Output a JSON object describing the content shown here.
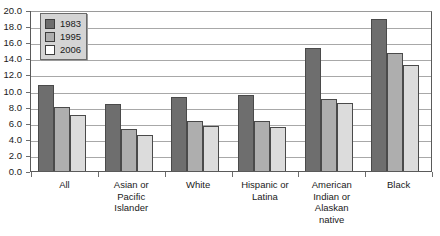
{
  "chart_data": {
    "type": "bar",
    "title": "",
    "subtitle": "",
    "xlabel": "",
    "ylabel": "",
    "ylim": [
      0.0,
      20.0
    ],
    "ytick_step": 2.0,
    "ytick_labels": [
      "20.0",
      "18.0",
      "16.0",
      "14.0",
      "12.0",
      "10.0",
      "8.0",
      "6.0",
      "4.0",
      "2.0",
      "0.0"
    ],
    "ytick_values": [
      20.0,
      18.0,
      16.0,
      14.0,
      12.0,
      10.0,
      8.0,
      6.0,
      4.0,
      2.0,
      0.0
    ],
    "grid": true,
    "grid_axis": "y",
    "legend_position": "top-left",
    "categories": [
      "All",
      "Asian or Pacific Islander",
      "White",
      "Hispanic or Latina",
      "American Indian or Alaskan native",
      "Black"
    ],
    "category_label_lines": [
      [
        "All"
      ],
      [
        "Asian or",
        "Pacific",
        "Islander"
      ],
      [
        "White"
      ],
      [
        "Hispanic or",
        "Latina"
      ],
      [
        "American",
        "Indian or",
        "Alaskan",
        "native"
      ],
      [
        "Black"
      ]
    ],
    "series": [
      {
        "name": "1983",
        "color": "#6e6e6e",
        "values": [
          10.7,
          8.3,
          9.2,
          9.4,
          15.3,
          18.9
        ]
      },
      {
        "name": "1995",
        "color": "#aeaeae",
        "values": [
          7.9,
          5.2,
          6.2,
          6.2,
          9.0,
          14.6
        ]
      },
      {
        "name": "2006",
        "color": "#dcdcdc",
        "values": [
          7.0,
          4.5,
          5.6,
          5.5,
          8.4,
          13.2
        ]
      }
    ]
  },
  "legend": {
    "entries": [
      {
        "label": "1983"
      },
      {
        "label": "1995"
      },
      {
        "label": "2006"
      }
    ]
  }
}
